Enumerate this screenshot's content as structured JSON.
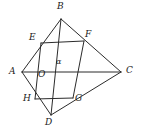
{
  "figure": {
    "name": "quadrilateral-with-inscribed-parallelogram",
    "background_color": "#ffffff",
    "stroke_color": "#2b2b2b",
    "label_color": "#1a1a1a",
    "stroke_width": 1
  },
  "points": {
    "A": {
      "label": "A",
      "x": 22,
      "y": 72,
      "label_x": 10,
      "label_y": 68
    },
    "B": {
      "label": "B",
      "x": 61,
      "y": 19,
      "label_x": 58,
      "label_y": 4
    },
    "C": {
      "label": "C",
      "x": 121,
      "y": 72,
      "label_x": 126,
      "label_y": 68
    },
    "D": {
      "label": "D",
      "x": 51,
      "y": 115,
      "label_x": 46,
      "label_y": 120
    },
    "E": {
      "label": "E",
      "x": 41,
      "y": 43,
      "label_x": 30,
      "label_y": 36
    },
    "F": {
      "label": "F",
      "x": 84,
      "y": 41,
      "label_x": 85,
      "label_y": 33
    },
    "G": {
      "label": "G",
      "x": 73,
      "y": 98,
      "label_x": 75,
      "label_y": 96
    },
    "H": {
      "label": "H",
      "x": 35,
      "y": 99,
      "label_x": 24,
      "label_y": 97
    },
    "O": {
      "label": "O",
      "x": 54,
      "y": 72,
      "label_x": 39,
      "label_y": 72
    }
  },
  "segments": [
    {
      "name": "side-AB",
      "from": "A",
      "to": "B"
    },
    {
      "name": "side-BC",
      "from": "B",
      "to": "C"
    },
    {
      "name": "side-CD",
      "from": "C",
      "to": "D"
    },
    {
      "name": "side-DA",
      "from": "D",
      "to": "A"
    },
    {
      "name": "diagonal-AC",
      "from": "A",
      "to": "C"
    },
    {
      "name": "diagonal-BD",
      "from": "B",
      "to": "D"
    },
    {
      "name": "midline-EF",
      "from": "E",
      "to": "F"
    },
    {
      "name": "midline-FG",
      "from": "F",
      "to": "G"
    },
    {
      "name": "midline-GH",
      "from": "G",
      "to": "H"
    },
    {
      "name": "midline-HE",
      "from": "H",
      "to": "E"
    }
  ],
  "angle": {
    "symbol": "α",
    "label_x": 57,
    "label_y": 60,
    "at_point": "O"
  }
}
